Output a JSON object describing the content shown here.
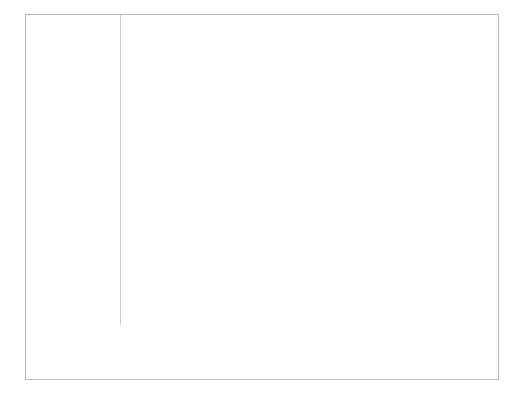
{
  "chart_data": {
    "type": "bar",
    "subtype": "diverging-stacked-bar",
    "title": "",
    "xlabel": "",
    "ylabel": "",
    "xlim": [
      -0.7,
      0.85
    ],
    "grid": true,
    "legend_position": "bottom",
    "xticks": [
      -0.6,
      -0.4,
      -0.2,
      0,
      0.2,
      0.4,
      0.6,
      0.8
    ],
    "xtick_labels": [
      "-0.6",
      "-0.4",
      "-0.2",
      "0",
      "0.2",
      "0.4",
      "0.6",
      "0.8"
    ],
    "legend": [
      {
        "label": "FAIR",
        "color": "#bfbfbf"
      },
      {
        "label": "POOR",
        "color": "#808080"
      },
      {
        "label": "VERY GOOD",
        "color": "#bfbfbf"
      },
      {
        "label": "EXCELLENT",
        "color": "#808080"
      }
    ],
    "categories": [
      {
        "label": "AGE 18-29",
        "type": "group",
        "segments": []
      },
      {
        "label": "White",
        "type": "bar",
        "segments": [
          {
            "series": "POOR",
            "start": -0.135,
            "end": -0.07,
            "color": "#808080"
          },
          {
            "series": "FAIR",
            "start": -0.07,
            "end": 0.0,
            "color": "#bfbfbf"
          },
          {
            "series": "VERY GOOD",
            "start": 0.0,
            "end": 0.45,
            "color": "#bfbfbf"
          },
          {
            "series": "EXCELLENT",
            "start": 0.45,
            "end": 0.65,
            "color": "#808080"
          }
        ]
      },
      {
        "label": "African-American",
        "type": "bar",
        "segments": [
          {
            "series": "POOR",
            "start": -0.55,
            "end": -0.52,
            "color": "#808080"
          },
          {
            "series": "FAIR",
            "start": -0.52,
            "end": 0.0,
            "color": "#bfbfbf"
          },
          {
            "series": "VERY GOOD",
            "start": 0.0,
            "end": 0.265,
            "color": "#bfbfbf"
          }
        ]
      },
      {
        "label": "AGE 30-44",
        "type": "group",
        "segments": []
      },
      {
        "label": "White",
        "type": "bar",
        "segments": [
          {
            "series": "POOR",
            "start": -0.175,
            "end": -0.13,
            "color": "#808080"
          },
          {
            "series": "FAIR",
            "start": -0.13,
            "end": 0.0,
            "color": "#bfbfbf"
          },
          {
            "series": "VERY GOOD",
            "start": 0.0,
            "end": 0.455,
            "color": "#bfbfbf"
          },
          {
            "series": "EXCELLENT",
            "start": 0.455,
            "end": 0.68,
            "color": "#808080"
          }
        ]
      },
      {
        "label": "African-American",
        "type": "bar",
        "segments": [
          {
            "series": "POOR",
            "start": -0.62,
            "end": -0.49,
            "color": "#808080"
          },
          {
            "series": "FAIR",
            "start": -0.49,
            "end": 0.0,
            "color": "#bfbfbf"
          },
          {
            "series": "VERY GOOD",
            "start": 0.0,
            "end": 0.14,
            "color": "#bfbfbf"
          },
          {
            "series": "EXCELLENT",
            "start": 0.14,
            "end": 0.165,
            "color": "#808080"
          }
        ]
      },
      {
        "label": "AGE 45-64",
        "type": "group",
        "segments": []
      },
      {
        "label": "White",
        "type": "bar",
        "segments": [
          {
            "series": "POOR",
            "start": -0.155,
            "end": -0.135,
            "color": "#808080"
          },
          {
            "series": "FAIR",
            "start": -0.135,
            "end": 0.0,
            "color": "#bfbfbf"
          },
          {
            "series": "VERY GOOD",
            "start": 0.0,
            "end": 0.48,
            "color": "#bfbfbf"
          },
          {
            "series": "EXCELLENT",
            "start": 0.48,
            "end": 0.655,
            "color": "#808080"
          }
        ]
      },
      {
        "label": "African-American",
        "type": "bar",
        "segments": [
          {
            "series": "POOR",
            "start": -0.53,
            "end": -0.41,
            "color": "#808080"
          },
          {
            "series": "FAIR",
            "start": -0.41,
            "end": 0.0,
            "color": "#bfbfbf"
          },
          {
            "series": "VERY GOOD",
            "start": 0.0,
            "end": 0.15,
            "color": "#bfbfbf"
          },
          {
            "series": "EXCELLENT",
            "start": 0.15,
            "end": 0.225,
            "color": "#808080"
          }
        ]
      },
      {
        "label": "AGE 65+",
        "type": "group",
        "segments": []
      },
      {
        "label": "White",
        "type": "bar",
        "segments": [
          {
            "series": "POOR",
            "start": -0.145,
            "end": -0.135,
            "color": "#808080"
          },
          {
            "series": "FAIR",
            "start": -0.135,
            "end": 0.0,
            "color": "#bfbfbf"
          },
          {
            "series": "VERY GOOD",
            "start": 0.0,
            "end": 0.515,
            "color": "#bfbfbf"
          },
          {
            "series": "EXCELLENT",
            "start": 0.515,
            "end": 0.73,
            "color": "#808080"
          }
        ]
      },
      {
        "label": "African-American",
        "type": "bar",
        "segments": [
          {
            "series": "POOR",
            "start": -0.49,
            "end": -0.415,
            "color": "#808080"
          },
          {
            "series": "FAIR",
            "start": -0.415,
            "end": 0.0,
            "color": "#bfbfbf"
          },
          {
            "series": "VERY GOOD",
            "start": 0.0,
            "end": 0.225,
            "color": "#bfbfbf"
          },
          {
            "series": "EXCELLENT",
            "start": 0.225,
            "end": 0.265,
            "color": "#808080"
          }
        ]
      }
    ],
    "colors": {
      "light_gray": "#bfbfbf",
      "dark_gray": "#808080",
      "gridline": "#d6d6d6",
      "frame": "#b9b9b9",
      "text": "#2b2b2b"
    }
  }
}
